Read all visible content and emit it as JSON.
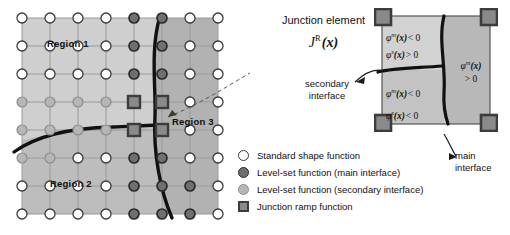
{
  "figure": {
    "type": "diagram"
  },
  "grid_panel": {
    "regions": [
      {
        "id": "region1",
        "label": "Region 1"
      },
      {
        "id": "region2",
        "label": "Region 2"
      },
      {
        "id": "region3",
        "label": "Region 3"
      }
    ],
    "grid": {
      "columns": 8,
      "rows": 8,
      "spacing_px": 28,
      "origin_x": 22,
      "origin_y": 18
    },
    "node_types": {
      "standard": "Standard shape function",
      "levelset_main": "Level-set function (main interface)",
      "levelset_secondary": "Level-set function (secondary interface)",
      "junction_ramp": "Junction ramp function"
    },
    "node_map": [
      [
        "w",
        "w",
        "w",
        "w",
        "d",
        "d",
        "w",
        "w"
      ],
      [
        "w",
        "w",
        "w",
        "w",
        "d",
        "d",
        "w",
        "w"
      ],
      [
        "w",
        "w",
        "w",
        "w",
        "d",
        "d",
        "w",
        "w"
      ],
      [
        "l",
        "l",
        "l",
        "l",
        "s",
        "s",
        "w",
        "w"
      ],
      [
        "l",
        "l",
        "l",
        "l",
        "s",
        "s",
        "w",
        "w"
      ],
      [
        "l",
        "l",
        "w",
        "w",
        "d",
        "d",
        "w",
        "w"
      ],
      [
        "w",
        "w",
        "w",
        "w",
        "d",
        "d",
        "d",
        "w"
      ],
      [
        "w",
        "w",
        "w",
        "w",
        "d",
        "d",
        "d",
        "w"
      ]
    ]
  },
  "annotations": {
    "junction_title": "Junction element",
    "junction_symbol_base": "J",
    "junction_symbol_sup": "R",
    "junction_symbol_arg": "(x)",
    "secondary_interface_label": "secondary\ninterface",
    "secondary_interface_line1": "secondary",
    "secondary_interface_line2": "interface",
    "main_interface_line1": "main",
    "main_interface_line2": "interface"
  },
  "zoom_panel": {
    "phi_upper_left": {
      "line1": {
        "symbol": "φ",
        "sup": "m",
        "arg": "(x)",
        "relation": "< 0"
      },
      "line2": {
        "symbol": "φ",
        "sup": "s",
        "arg": "(x)",
        "relation": "> 0"
      }
    },
    "phi_lower_left": {
      "line1": {
        "symbol": "φ",
        "sup": "m",
        "arg": "(x)",
        "relation": "< 0"
      },
      "line2": {
        "symbol": "φ",
        "sup": "s",
        "arg": "(x)",
        "relation": "< 0"
      }
    },
    "phi_right": {
      "line1": {
        "symbol": "φ",
        "sup": "m",
        "arg": "(x)"
      },
      "line2": {
        "relation": "> 0"
      }
    },
    "corner_marker_count": 4
  },
  "legend": {
    "items": [
      {
        "marker": "standard-shape-node-icon",
        "label": "Standard shape function"
      },
      {
        "marker": "levelset-main-node-icon",
        "label": "Level-set function (main interface)"
      },
      {
        "marker": "levelset-secondary-node-icon",
        "label": "Level-set function (secondary interface)"
      },
      {
        "marker": "junction-ramp-node-icon",
        "label": "Junction ramp function"
      }
    ]
  },
  "colors": {
    "node_standard_fill": "#ffffff",
    "node_standard_stroke": "#3a3a3a",
    "node_main_fill": "#6f6f6f",
    "node_main_stroke": "#2b2b2b",
    "node_secondary_fill": "#b6b6b6",
    "node_secondary_stroke": "#8d8d8d",
    "node_junction_fill": "#8a8a8a",
    "node_junction_stroke": "#3c3c3c",
    "interface_curve": "#111111",
    "region1_fill": "#c9c9c9",
    "region2_fill": "#c2c2c2",
    "region3_fill": "#b4b4b4",
    "grid_line": "#9a9a9a",
    "text": "#111111"
  }
}
